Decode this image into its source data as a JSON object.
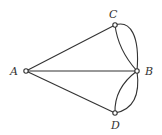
{
  "diagram": {
    "type": "multigraph",
    "nodes": [
      {
        "id": "A",
        "label": "A"
      },
      {
        "id": "B",
        "label": "B"
      },
      {
        "id": "C",
        "label": "C"
      },
      {
        "id": "D",
        "label": "D"
      }
    ],
    "edges": [
      {
        "from": "A",
        "to": "C"
      },
      {
        "from": "A",
        "to": "B"
      },
      {
        "from": "A",
        "to": "D"
      },
      {
        "from": "C",
        "to": "B",
        "curve": "inner"
      },
      {
        "from": "C",
        "to": "B",
        "curve": "outer"
      },
      {
        "from": "D",
        "to": "B",
        "curve": "inner"
      },
      {
        "from": "D",
        "to": "B",
        "curve": "outer"
      }
    ],
    "colors": {
      "stroke": "#333333",
      "background": "#ffffff"
    }
  }
}
